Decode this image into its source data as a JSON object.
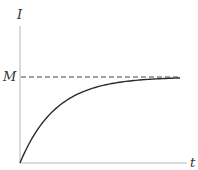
{
  "chart_data": {
    "type": "line",
    "title": "",
    "xlabel": "t",
    "ylabel": "I",
    "asymptote_label": "M",
    "grid": false,
    "legend": null,
    "series": [
      {
        "name": "I(t)",
        "x": [
          0,
          10,
          20,
          30,
          40,
          60,
          80,
          100,
          120,
          140,
          160
        ],
        "values_fraction_of_M": [
          0,
          0.24,
          0.43,
          0.57,
          0.67,
          0.81,
          0.89,
          0.94,
          0.97,
          0.98,
          0.99
        ]
      }
    ],
    "asymptote": {
      "label": "M",
      "style": "dashed",
      "fraction": 1.0
    },
    "ylim": [
      0,
      "above M"
    ],
    "xlim": [
      0,
      "t"
    ]
  },
  "labels": {
    "y_axis": "I",
    "x_axis": "t",
    "asymptote": "M"
  },
  "colors": {
    "axis": "#b0b0b0",
    "curve": "#2a2a2a",
    "dashed": "#444444",
    "text": "#333333"
  }
}
